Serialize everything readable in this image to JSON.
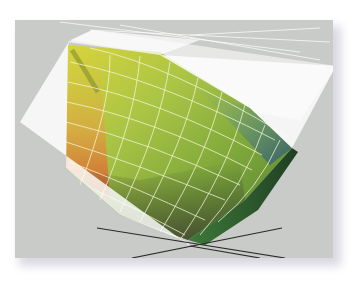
{
  "figure": {
    "panel_color": "#c9cbc8",
    "shadow_color": "#968caa",
    "outer_gamut": {
      "label": "outer-gamut-wireframe",
      "fill": "#ffffff",
      "opacity": 0.78
    },
    "inner_gamut": {
      "label": "inner-gamut-solid",
      "colors": {
        "yellow": "#d8d640",
        "green": "#8fb53c",
        "orange": "#d8703a",
        "dark_green": "#2d5a2a",
        "blue_edge": "#3d6a7a"
      },
      "grid_line_color": "#f3f6d8"
    },
    "axes": {
      "color": "#2b2b2b"
    }
  }
}
